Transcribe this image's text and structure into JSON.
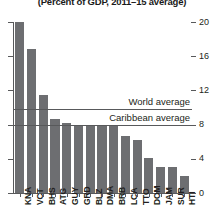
{
  "chart_data": {
    "type": "bar",
    "title": "(Percent of GDP, 2011–15 average)",
    "xlabel": "",
    "ylabel": "",
    "ylim": [
      0,
      20
    ],
    "yticks": [
      0,
      4,
      8,
      12,
      16,
      20
    ],
    "grid": false,
    "legend": "none",
    "bar_color": "#6d6e71",
    "categories": [
      "KNA",
      "VCT",
      "BHS",
      "ATG",
      "GUY",
      "GRD",
      "BLZ",
      "DMA",
      "BRB",
      "LCA",
      "TTO",
      "DOM",
      "JAM",
      "SUR",
      "HTI"
    ],
    "values": [
      20.0,
      16.9,
      11.5,
      8.6,
      8.2,
      7.8,
      7.8,
      7.8,
      7.8,
      6.7,
      6.2,
      4.1,
      3.1,
      3.1,
      2.0
    ],
    "annotations": [
      {
        "label": "World average",
        "value": 9.8,
        "type": "hline"
      },
      {
        "label": "Caribbean average",
        "value": 8.0,
        "type": "hline"
      }
    ]
  }
}
